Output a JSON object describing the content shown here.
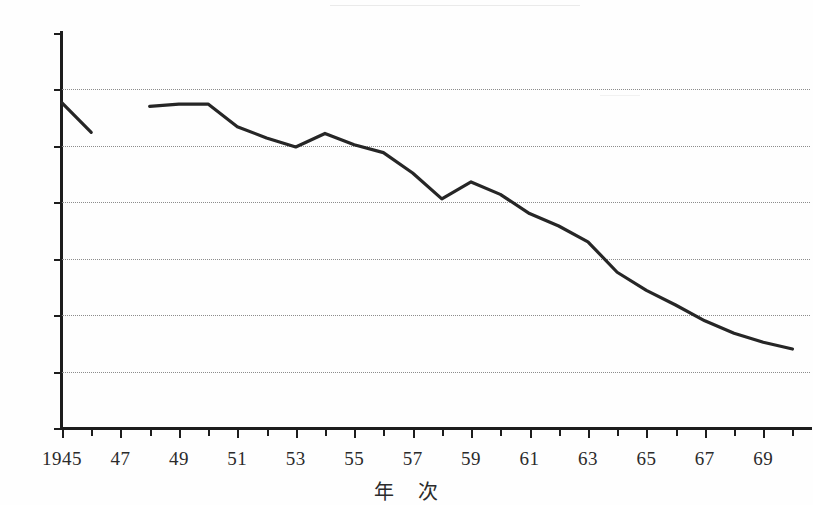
{
  "chart_data": {
    "type": "line",
    "title": "",
    "xlabel": "年　次",
    "ylabel": "",
    "xlim": [
      1945,
      1970.6
    ],
    "ylim": [
      0,
      35
    ],
    "y_tick_labels": [
      "35%",
      "30%",
      "25%",
      "20%",
      "15%",
      "10%",
      "5%",
      "0%"
    ],
    "y_tick_values": [
      35,
      30,
      25,
      20,
      15,
      10,
      5,
      0
    ],
    "x_tick_values": [
      1945,
      1946,
      1947,
      1948,
      1949,
      1950,
      1951,
      1952,
      1953,
      1954,
      1955,
      1956,
      1957,
      1958,
      1959,
      1960,
      1961,
      1962,
      1963,
      1964,
      1965,
      1966,
      1967,
      1968,
      1969,
      1970
    ],
    "x_tick_labels": [
      "1945",
      "",
      "47",
      "",
      "49",
      "",
      "51",
      "",
      "53",
      "",
      "55",
      "",
      "57",
      "",
      "59",
      "",
      "61",
      "",
      "63",
      "",
      "65",
      "",
      "67",
      "",
      "69",
      ""
    ],
    "grid": "horizontal-dotted",
    "legend": "none",
    "line_color": "#262626",
    "grid_color": "#8c8c8c",
    "axis_color": "#1d1d1d",
    "series": [
      {
        "name": "percentage",
        "x": [
          1945,
          1946
        ],
        "values": [
          28.8,
          26.2
        ]
      },
      {
        "name": "percentage",
        "x": [
          1948,
          1949,
          1950,
          1951,
          1952,
          1953,
          1954,
          1955,
          1956,
          1957,
          1958,
          1959,
          1960,
          1961,
          1962,
          1963,
          1964,
          1965,
          1966,
          1967,
          1968,
          1969,
          1970
        ],
        "values": [
          28.5,
          28.7,
          28.7,
          26.7,
          25.7,
          24.9,
          26.1,
          25.1,
          24.4,
          22.6,
          20.3,
          21.8,
          20.7,
          19.0,
          17.9,
          16.5,
          13.8,
          12.2,
          10.9,
          9.5,
          8.4,
          7.6,
          7.0
        ]
      }
    ],
    "data_gap": {
      "from": 1946,
      "to": 1948,
      "note": "no data plotted for 1947"
    }
  }
}
